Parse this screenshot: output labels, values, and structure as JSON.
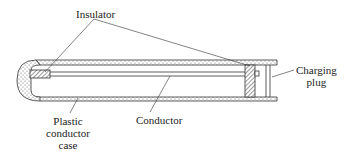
{
  "diagram": {
    "labels": {
      "insulator": "Insulator",
      "charging_plug_line1": "Charging",
      "charging_plug_line2": "plug",
      "case_line1": "Plastic",
      "case_line2": "conductor",
      "case_line3": "case",
      "conductor": "Conductor"
    },
    "colors": {
      "stroke": "#333333",
      "text": "#222222",
      "background": "#ffffff"
    }
  }
}
